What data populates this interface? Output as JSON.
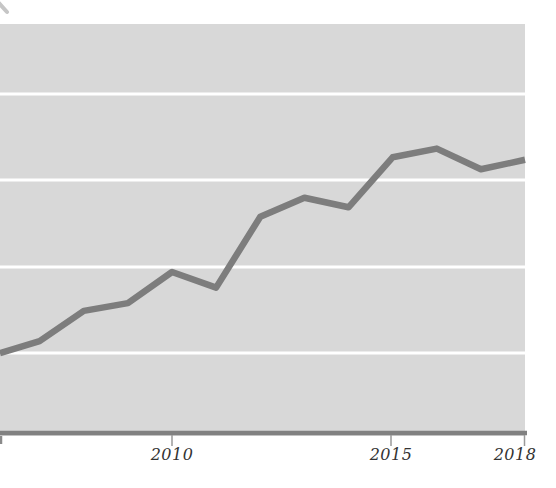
{
  "chart_data": {
    "type": "line",
    "title": "",
    "subtitle": "",
    "xlabel": "",
    "ylabel": "",
    "legend": "none",
    "grid": "horizontal-white-lines",
    "x_range": [
      2006.1,
      2018
    ],
    "y_range_units": [
      0,
      4.77
    ],
    "gridline_units": [
      1,
      2,
      3,
      4
    ],
    "x_ticks": [
      {
        "label": "2010",
        "label_x_px": 172,
        "mark_x_px": 172
      },
      {
        "label": "2015",
        "label_x_px": 391,
        "mark_x_px": 391
      },
      {
        "label": "2018",
        "label_x_px": 515,
        "mark_x_px": 524.5
      }
    ],
    "series": [
      {
        "name": "series-1",
        "color": "#7d7d7d",
        "stroke_width_px": 6.5,
        "points": [
          {
            "year": 2006.1,
            "value": 0.96
          },
          {
            "year": 2007,
            "value": 1.1
          },
          {
            "year": 2008,
            "value": 1.45
          },
          {
            "year": 2009,
            "value": 1.54
          },
          {
            "year": 2010,
            "value": 1.9
          },
          {
            "year": 2011,
            "value": 1.72
          },
          {
            "year": 2012,
            "value": 2.54
          },
          {
            "year": 2013,
            "value": 2.76
          },
          {
            "year": 2014,
            "value": 2.65
          },
          {
            "year": 2015,
            "value": 3.23
          },
          {
            "year": 2016,
            "value": 3.33
          },
          {
            "year": 2017,
            "value": 3.09
          },
          {
            "year": 2018,
            "value": 3.2
          }
        ]
      }
    ],
    "pixel_map": {
      "canvas_w": 556,
      "canvas_h": 488,
      "plot": {
        "left": 0,
        "top": 24,
        "right": 525,
        "bottom": 436
      },
      "x_at_2010": 172,
      "px_per_year": 44.125,
      "y_baseline": 436,
      "px_per_unit": 86.3,
      "gridline_y_px": [
        94,
        180,
        267,
        353
      ],
      "axis_y_px": 433,
      "axis_right_px": 527,
      "tick_top_px": 435,
      "tick_bottom_px": 446,
      "label_top_px": 447,
      "edge_tick": {
        "x": 1,
        "y1": 436,
        "y2": 444
      },
      "artifact_mark": {
        "x1": -2,
        "y1": 2,
        "x2": 7,
        "y2": 12
      }
    },
    "colors": {
      "page_bg": "#ffffff",
      "plot_bg": "#d8d8d8",
      "gridline": "#ffffff",
      "line": "#7d7d7d",
      "axis": "#818181",
      "tick": "#9a9a9a",
      "label": "#333333",
      "artifact": "#c6c6c6"
    }
  }
}
